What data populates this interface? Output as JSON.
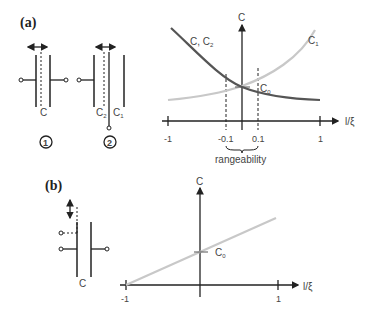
{
  "panel_a": {
    "label": "(a)",
    "circuit1": {
      "cap_label": "C",
      "number": "1"
    },
    "circuit2": {
      "cap_label_left": "C",
      "cap_label_left_sub": "2",
      "cap_label_right": "C",
      "cap_label_right_sub": "1",
      "number": "2"
    },
    "chart": {
      "y_axis_label": "C",
      "x_axis_label": "l/ξ",
      "curve_dark_label": "C, C",
      "curve_dark_label_sub": "2",
      "curve_light_label": "C",
      "curve_light_label_sub": "1",
      "center_label": "C",
      "center_label_sub": "0",
      "ticks": [
        "-1",
        "-0.1",
        "0.1",
        "1"
      ],
      "annotation": "rangeability"
    }
  },
  "panel_b": {
    "label": "(b)",
    "circuit": {
      "cap_label": "C"
    },
    "chart": {
      "y_axis_label": "C",
      "x_axis_label": "l/ξ",
      "center_label": "C",
      "center_label_sub": "0",
      "ticks": [
        "-1",
        "1"
      ]
    }
  },
  "colors": {
    "dark_curve": "#555555",
    "light_curve": "#c8c8c8",
    "axis": "#222222"
  }
}
